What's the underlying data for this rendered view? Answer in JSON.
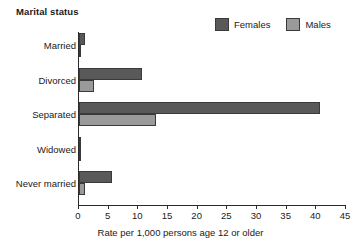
{
  "chart_data": {
    "type": "bar",
    "orientation": "horizontal",
    "title": "Marital status",
    "xlabel": "Rate per 1,000 persons age 12 or older",
    "ylabel": "",
    "categories": [
      "Married",
      "Divorced",
      "Separated",
      "Widowed",
      "Never married"
    ],
    "series": [
      {
        "name": "Females",
        "color": "#595959",
        "values": [
          1.0,
          10.6,
          40.6,
          0.4,
          5.5
        ]
      },
      {
        "name": "Males",
        "color": "#9a9a9a",
        "values": [
          0.3,
          2.5,
          13.0,
          0.2,
          1.0
        ]
      }
    ],
    "xlim": [
      0,
      45
    ],
    "xticks": [
      0,
      5,
      10,
      15,
      20,
      25,
      30,
      35,
      40,
      45
    ],
    "xtick_labels": [
      "0",
      "5",
      "10",
      "15",
      "20",
      "25",
      "30",
      "35",
      "40",
      "45"
    ],
    "grid": false,
    "legend_position": "top-right",
    "legend": [
      "Females",
      "Males"
    ]
  },
  "colors": {
    "female_fill": "#595959",
    "male_fill": "#9a9a9a",
    "bar_outline": "#3a3a3a",
    "axis": "#2a2a2a",
    "text": "#1a1a1a",
    "background": "#ffffff"
  }
}
